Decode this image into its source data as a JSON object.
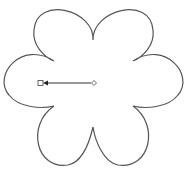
{
  "diagram": {
    "shape": "six-petal-flower",
    "stroke_color": "#555555",
    "background": "#ffffff",
    "center": {
      "x": 93,
      "y": 83
    },
    "petals": 6,
    "handle": {
      "start_marker": "diamond",
      "end_marker": "square",
      "direction": "left",
      "color": "#333333"
    }
  }
}
